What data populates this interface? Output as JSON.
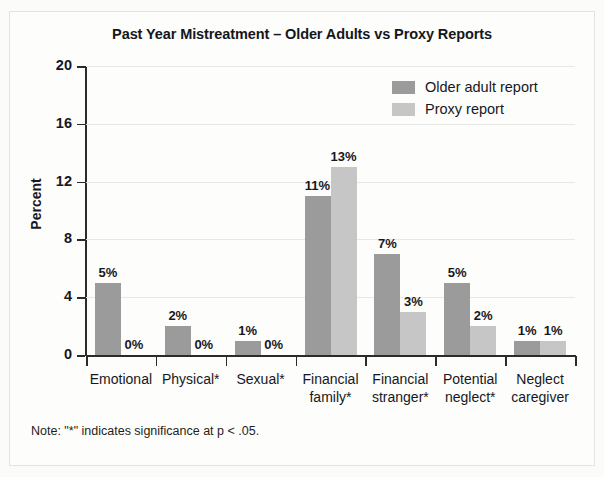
{
  "chart_data": {
    "type": "bar",
    "title": "Past Year Mistreatment – Older Adults vs Proxy Reports",
    "xlabel": "",
    "ylabel": "Percent",
    "ylim": [
      0,
      20
    ],
    "yticks": [
      0,
      4,
      8,
      12,
      16,
      20
    ],
    "ytick_labels": [
      "0",
      "4",
      "8",
      "12",
      "16",
      "20"
    ],
    "grid": true,
    "legend_position": "top-right",
    "categories": [
      "Emotional",
      "Physical*",
      "Sexual*",
      "Financial family*",
      "Financial stranger*",
      "Potential neglect*",
      "Neglect caregiver"
    ],
    "category_lines": [
      [
        "Emotional"
      ],
      [
        "Physical*"
      ],
      [
        "Sexual*"
      ],
      [
        "Financial",
        "family*"
      ],
      [
        "Financial",
        "stranger*"
      ],
      [
        "Potential",
        "neglect*"
      ],
      [
        "Neglect",
        "caregiver"
      ]
    ],
    "series": [
      {
        "name": "Older adult report",
        "color": "#9b9b9b",
        "values": [
          5,
          2,
          1,
          11,
          7,
          5,
          1
        ],
        "labels": [
          "5%",
          "2%",
          "1%",
          "11%",
          "7%",
          "5%",
          "1%"
        ]
      },
      {
        "name": "Proxy report",
        "color": "#c6c6c6",
        "values": [
          0,
          0,
          0,
          13,
          3,
          2,
          1
        ],
        "labels": [
          "0%",
          "0%",
          "0%",
          "13%",
          "3%",
          "2%",
          "1%"
        ]
      }
    ],
    "note": "Note: \"*\" indicates significance at p < .05."
  },
  "legend": {
    "items": [
      {
        "label": "Older adult report",
        "swatch": "dark"
      },
      {
        "label": "Proxy report",
        "swatch": "light"
      }
    ]
  }
}
